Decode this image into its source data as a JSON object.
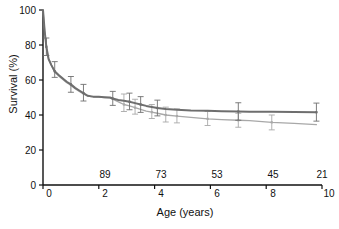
{
  "chart_data": {
    "type": "line",
    "title": "",
    "xlabel": "Age (years)",
    "ylabel": "Survival (%)",
    "xlim": [
      0,
      10
    ],
    "ylim": [
      0,
      100
    ],
    "xticks": [
      0,
      2,
      4,
      6,
      8,
      10
    ],
    "xtick_labels": [
      "0",
      "2",
      "4",
      "6",
      "8",
      "10"
    ],
    "yticks": [
      0,
      20,
      40,
      60,
      80,
      100
    ],
    "ytick_labels": [
      "0",
      "20",
      "40",
      "60",
      "80",
      "100"
    ],
    "grid": false,
    "legend": "none",
    "at_risk_label": "",
    "at_risk_x": [
      2,
      4,
      6,
      8,
      10
    ],
    "at_risk_counts": [
      "89",
      "73",
      "53",
      "45",
      "21"
    ],
    "colors": {
      "series_1": "#6e6e6e",
      "series_2": "#a8a8a8",
      "axis": "#111111",
      "background": "#ffffff"
    },
    "series": [
      {
        "name": "Series 1",
        "color": "#6e6e6e",
        "linewidth": 2.0,
        "x": [
          0.0,
          0.06,
          0.12,
          0.2,
          0.3,
          0.42,
          0.55,
          0.7,
          0.85,
          1.0,
          1.15,
          1.3,
          1.45,
          1.6,
          1.8,
          2.0,
          2.2,
          2.4,
          2.5,
          2.7,
          2.9,
          3.1,
          3.3,
          3.5,
          3.7,
          3.9,
          4.1,
          4.4,
          4.8,
          5.3,
          5.9,
          6.4,
          7.0,
          7.4,
          8.2,
          9.0,
          9.8
        ],
        "y": [
          100.0,
          88.0,
          79.0,
          72.0,
          68.5,
          65.0,
          63.0,
          61.0,
          59.0,
          57.5,
          55.5,
          54.0,
          52.5,
          51.0,
          50.5,
          50.4,
          50.2,
          50.0,
          49.4,
          48.6,
          48.2,
          47.6,
          46.8,
          46.0,
          45.2,
          44.6,
          44.0,
          43.4,
          43.0,
          42.6,
          42.4,
          42.2,
          42.0,
          41.9,
          41.8,
          41.7,
          41.6
        ],
        "error_bars": [
          {
            "x": 0.12,
            "y": 79.0,
            "lo": 74.0,
            "hi": 84.0
          },
          {
            "x": 0.42,
            "y": 65.0,
            "lo": 61.5,
            "hi": 70.5
          },
          {
            "x": 1.0,
            "y": 57.5,
            "lo": 53.0,
            "hi": 62.0
          },
          {
            "x": 1.45,
            "y": 52.5,
            "lo": 48.0,
            "hi": 57.5
          },
          {
            "x": 2.5,
            "y": 49.4,
            "lo": 45.5,
            "hi": 53.5
          },
          {
            "x": 3.1,
            "y": 47.6,
            "lo": 43.0,
            "hi": 52.5
          },
          {
            "x": 3.5,
            "y": 46.0,
            "lo": 41.5,
            "hi": 50.5
          },
          {
            "x": 4.1,
            "y": 44.0,
            "lo": 39.5,
            "hi": 48.5
          },
          {
            "x": 7.0,
            "y": 42.0,
            "lo": 37.0,
            "hi": 47.0
          },
          {
            "x": 9.8,
            "y": 41.6,
            "lo": 36.5,
            "hi": 46.8
          }
        ]
      },
      {
        "name": "Series 2",
        "color": "#a8a8a8",
        "linewidth": 1.3,
        "x": [
          0.0,
          0.06,
          0.12,
          0.2,
          0.3,
          0.42,
          0.55,
          0.7,
          0.85,
          1.0,
          1.15,
          1.3,
          1.45,
          1.6,
          1.8,
          2.0,
          2.2,
          2.4,
          2.5,
          2.7,
          2.9,
          3.1,
          3.3,
          3.5,
          3.7,
          3.9,
          4.1,
          4.4,
          4.8,
          5.3,
          5.9,
          6.4,
          7.0,
          7.4,
          8.2,
          9.0,
          9.8
        ],
        "y": [
          100.0,
          88.0,
          79.0,
          72.0,
          68.5,
          64.5,
          62.5,
          60.5,
          58.5,
          57.0,
          55.0,
          53.5,
          52.0,
          50.8,
          50.3,
          50.2,
          50.0,
          49.8,
          49.0,
          47.5,
          46.0,
          45.2,
          44.2,
          43.2,
          42.2,
          41.6,
          41.0,
          40.0,
          39.4,
          38.6,
          37.8,
          37.4,
          37.0,
          36.8,
          35.8,
          35.2,
          34.5
        ],
        "error_bars": [
          {
            "x": 2.9,
            "y": 46.0,
            "lo": 42.0,
            "hi": 52.0
          },
          {
            "x": 3.3,
            "y": 44.2,
            "lo": 40.5,
            "hi": 49.0
          },
          {
            "x": 3.9,
            "y": 41.6,
            "lo": 38.0,
            "hi": 46.0
          },
          {
            "x": 4.4,
            "y": 40.0,
            "lo": 36.0,
            "hi": 44.5
          },
          {
            "x": 4.8,
            "y": 39.4,
            "lo": 35.5,
            "hi": 43.5
          },
          {
            "x": 5.9,
            "y": 37.8,
            "lo": 34.0,
            "hi": 42.0
          },
          {
            "x": 7.0,
            "y": 37.0,
            "lo": 33.0,
            "hi": 41.0
          },
          {
            "x": 8.2,
            "y": 35.8,
            "lo": 31.5,
            "hi": 40.0
          }
        ]
      }
    ]
  }
}
